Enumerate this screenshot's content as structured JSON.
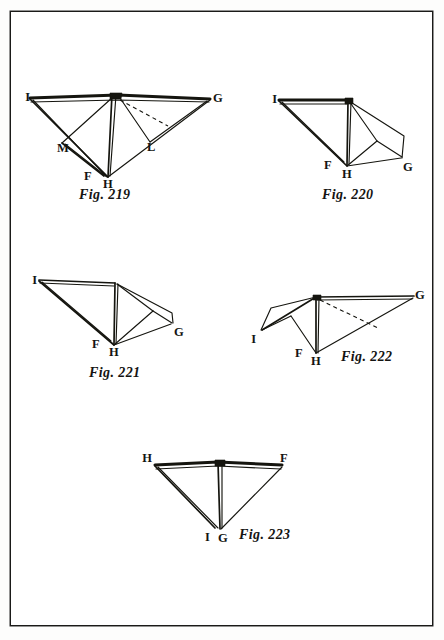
{
  "plate": {
    "kind": "engraved-figure-plate",
    "background_color": "#ffffff",
    "ink_color": "#15150f",
    "border_color": "#1a1a18",
    "border_rect": {
      "x": 10,
      "y": 11,
      "w": 421,
      "h": 613
    }
  },
  "figures": [
    {
      "id": "fig-219",
      "caption": "Fig. 219",
      "caption_pos": {
        "x": 79,
        "y": 196
      },
      "vertices": [
        {
          "label": "I",
          "x": 30,
          "y": 98,
          "text_x": 30,
          "text_y": 101
        },
        {
          "label": "G",
          "x": 210,
          "y": 99,
          "text_x": 206,
          "text_y": 102
        },
        {
          "label": "M",
          "x": 62,
          "y": 143,
          "text_x": 60,
          "text_y": 147
        },
        {
          "label": "L",
          "x": 150,
          "y": 142,
          "text_x": 148,
          "text_y": 146
        },
        {
          "label": "F",
          "x": 93,
          "y": 172,
          "text_x": 85,
          "text_y": 176
        },
        {
          "label": "H",
          "x": 108,
          "y": 177,
          "text_x": 104,
          "text_y": 182
        }
      ]
    },
    {
      "id": "fig-220",
      "caption": "Fig. 220",
      "caption_pos": {
        "x": 322,
        "y": 196
      },
      "vertices": [
        {
          "label": "I",
          "x": 279,
          "y": 100,
          "text_x": 277,
          "text_y": 103
        },
        {
          "label": "G",
          "x": 402,
          "y": 159,
          "text_x": 400,
          "text_y": 165
        },
        {
          "label": "F",
          "x": 333,
          "y": 160,
          "text_x": 326,
          "text_y": 165
        },
        {
          "label": "H",
          "x": 347,
          "y": 166,
          "text_x": 343,
          "text_y": 172
        }
      ]
    },
    {
      "id": "fig-221",
      "caption": "Fig. 221",
      "caption_pos": {
        "x": 89,
        "y": 374
      },
      "vertices": [
        {
          "label": "I",
          "x": 39,
          "y": 280,
          "text_x": 37,
          "text_y": 283
        },
        {
          "label": "G",
          "x": 174,
          "y": 325,
          "text_x": 172,
          "text_y": 331
        },
        {
          "label": "F",
          "x": 101,
          "y": 339,
          "text_x": 94,
          "text_y": 345
        },
        {
          "label": "H",
          "x": 114,
          "y": 345,
          "text_x": 110,
          "text_y": 351
        }
      ]
    },
    {
      "id": "fig-222",
      "caption": "Fig. 222",
      "caption_pos": {
        "x": 341,
        "y": 358
      },
      "vertices": [
        {
          "label": "G",
          "x": 414,
          "y": 296,
          "text_x": 411,
          "text_y": 299
        },
        {
          "label": "I",
          "x": 260,
          "y": 330,
          "text_x": 255,
          "text_y": 337
        },
        {
          "label": "F",
          "x": 303,
          "y": 349,
          "text_x": 297,
          "text_y": 355
        },
        {
          "label": "H",
          "x": 316,
          "y": 354,
          "text_x": 312,
          "text_y": 360
        }
      ]
    },
    {
      "id": "fig-223",
      "caption": "Fig. 223",
      "caption_pos": {
        "x": 239,
        "y": 535
      },
      "vertices": [
        {
          "label": "H",
          "x": 155,
          "y": 465,
          "text_x": 151,
          "text_y": 463
        },
        {
          "label": "F",
          "x": 282,
          "y": 465,
          "text_x": 279,
          "text_y": 463
        },
        {
          "label": "I",
          "x": 213,
          "y": 528,
          "text_x": 205,
          "text_y": 536
        },
        {
          "label": "G",
          "x": 222,
          "y": 529,
          "text_x": 219,
          "text_y": 537
        }
      ]
    }
  ]
}
